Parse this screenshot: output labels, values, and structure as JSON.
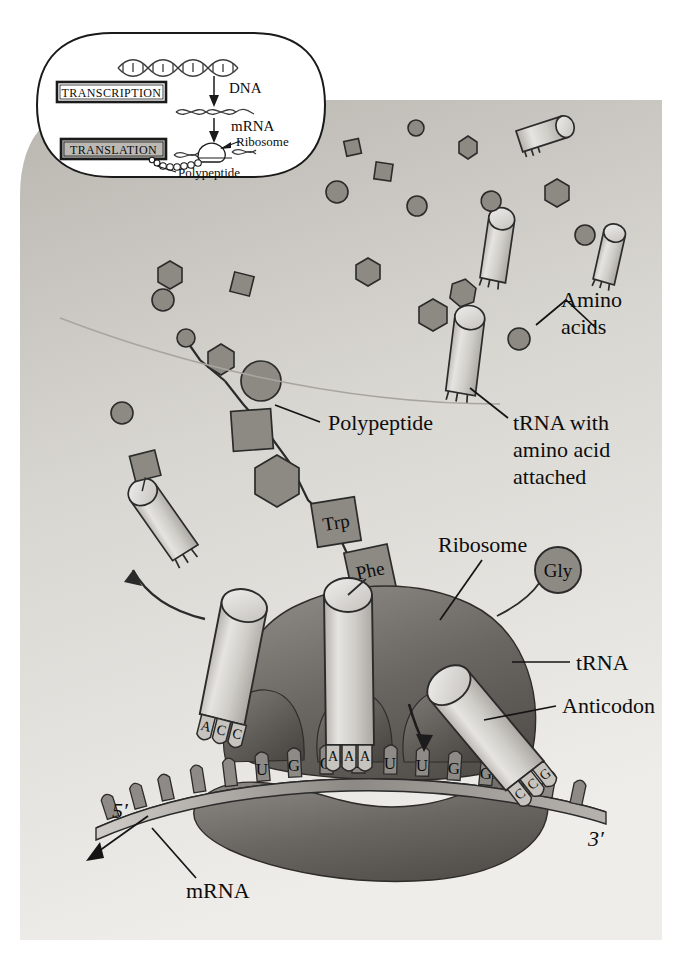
{
  "figure": {
    "background_color": "#f2f1ee",
    "cytoplasm_color": "#cfcdc8",
    "ribosome_color": "#6e6a66",
    "trna_color": "#cdcbc6",
    "amino_acid_color": "#8a8781",
    "outline_color": "#1a1a1a"
  },
  "inset": {
    "name": "transcription-translation-overview",
    "steps": [
      {
        "id": "transcription",
        "label": "TRANSCRIPTION",
        "boxed": true,
        "shaded": false
      },
      {
        "id": "translation",
        "label": "TRANSLATION",
        "boxed": true,
        "shaded": true
      }
    ],
    "labels": {
      "dna": "DNA",
      "mrna": "mRNA",
      "ribosome": "Ribosome",
      "polypeptide": "Polypeptide"
    }
  },
  "main": {
    "labels": {
      "amino_acids": "Amino\nacids",
      "amino_acids_line1": "Amino",
      "amino_acids_line2": "acids",
      "trna_with_amino_acid_line1": "tRNA with",
      "trna_with_amino_acid_line2": "amino acid",
      "trna_with_amino_acid_line3": "attached",
      "polypeptide": "Polypeptide",
      "ribosome": "Ribosome",
      "trna": "tRNA",
      "anticodon": "Anticodon",
      "mrna": "mRNA",
      "five_prime": "5′",
      "three_prime": "3′"
    },
    "amino_acid_tags": {
      "trp": "Trp",
      "phe": "Phe",
      "gly": "Gly"
    },
    "mrna_bases": [
      "U",
      "G",
      "G",
      "U",
      "U",
      "U",
      "G",
      "G",
      "C"
    ],
    "trna_anticodons": [
      {
        "position": "E-site",
        "bases": [
          "A",
          "C",
          "C"
        ]
      },
      {
        "position": "P-site",
        "bases": [
          "A",
          "A",
          "A"
        ]
      },
      {
        "position": "A-site",
        "bases": [
          "C",
          "C",
          "G"
        ]
      }
    ],
    "polypeptide_residue_shapes": [
      "circle",
      "hexagon",
      "circle",
      "square",
      "hexagon",
      "square",
      "square"
    ],
    "free_amino_acid_shapes": [
      "circle",
      "square",
      "hexagon",
      "circle",
      "square",
      "hexagon",
      "circle",
      "circle",
      "hexagon",
      "circle",
      "square",
      "hexagon",
      "circle",
      "circle"
    ],
    "free_trna_count": 5
  }
}
